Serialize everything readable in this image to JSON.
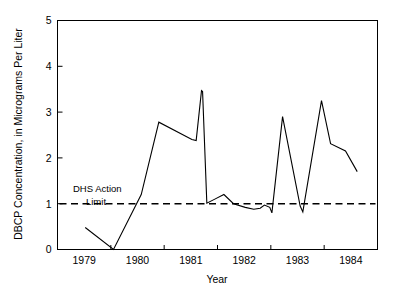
{
  "chart_data": {
    "type": "line",
    "title": "",
    "xlabel": "Year",
    "ylabel": "DBCP Concentration, in Micrograms Per Liter",
    "xlim": [
      1978.5,
      1984.5
    ],
    "ylim": [
      0,
      5
    ],
    "grid": false,
    "legend": "none",
    "xticks": [
      1979,
      1980,
      1981,
      1982,
      1983,
      1984
    ],
    "xticklabels": [
      "1979",
      "1980",
      "1981",
      "1982",
      "1983",
      "1984"
    ],
    "minor_xticks": [
      1979.5,
      1980.5,
      1981.5,
      1982.5,
      1983.5,
      1984.5
    ],
    "yticks": [
      0,
      1,
      2,
      3,
      4,
      5
    ],
    "yticklabels": [
      "0",
      "1",
      "2",
      "3",
      "4",
      "5"
    ],
    "series": [
      {
        "name": "DBCP concentration",
        "color": "#000000",
        "x": [
          1979.02,
          1979.55,
          1980.07,
          1980.4,
          1981.02,
          1981.1,
          1981.2,
          1981.22,
          1981.3,
          1981.45,
          1981.62,
          1981.8,
          1982.02,
          1982.18,
          1982.3,
          1982.38,
          1982.48,
          1982.52,
          1982.72,
          1983.05,
          1983.1,
          1983.45,
          1983.62,
          1983.9,
          1984.12
        ],
        "y": [
          0.48,
          0.0,
          1.2,
          2.78,
          2.4,
          2.38,
          3.47,
          3.45,
          1.01,
          1.1,
          1.2,
          1.0,
          0.92,
          0.88,
          0.9,
          0.97,
          0.92,
          0.8,
          2.9,
          0.95,
          0.82,
          3.25,
          2.31,
          2.15,
          1.7
        ]
      }
    ],
    "reference_line": {
      "name": "DHS Action Limit",
      "value": 1.0,
      "style": "dashed",
      "color": "#000000",
      "label_line1": "DHS Action",
      "label_line2": "Limit"
    }
  },
  "axes": {
    "x_axis_title": "Year",
    "y_axis_title": "DBCP Concentration, in Micrograms Per Liter"
  },
  "annotations": {
    "dhs_line1": "DHS Action",
    "dhs_line2": "Limit"
  },
  "ticks": {
    "x": [
      "1979",
      "1980",
      "1981",
      "1982",
      "1983",
      "1984"
    ],
    "y": [
      "0",
      "1",
      "2",
      "3",
      "4",
      "5"
    ]
  }
}
